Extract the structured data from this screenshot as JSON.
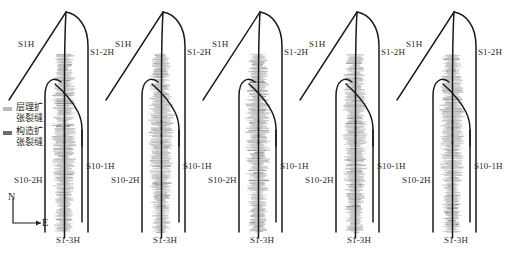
{
  "figure": {
    "type": "well-trajectory-microseismic-map",
    "background": "#ffffff",
    "panel_count": 5,
    "panel_pitch_px": 97,
    "panel_first_x_px": 8
  },
  "legend": {
    "items": [
      {
        "swatch_color": "#b9b9b9",
        "label": "层理扩\n张裂缝",
        "line1": "层理扩",
        "line2": "张裂缝",
        "key": "bedding-expansion-fracture"
      },
      {
        "swatch_color": "#6e6e6e",
        "label": "构造扩\n张裂缝",
        "line1": "构造扩",
        "line2": "张裂缝",
        "key": "structural-expansion-fracture"
      }
    ]
  },
  "compass": {
    "north_label": "N",
    "east_label": "E"
  },
  "well_labels": {
    "s1h": "S1H",
    "s1_2h": "S1-2H",
    "s1_3h": "S1-3H",
    "s10_1h": "S10-1H",
    "s10_2h": "S10-2H"
  },
  "panels": [
    {
      "index": 0,
      "x": 8,
      "labels": {
        "s1h": "S1H",
        "s1_2h": "S1-2H",
        "s1_3h": "S1-3H",
        "s10_1h": "S10-1H",
        "s10_2h": "S10-2H"
      }
    },
    {
      "index": 1,
      "x": 105,
      "labels": {
        "s1h": "S1H",
        "s1_2h": "S1-2H",
        "s1_3h": "S1-3H",
        "s10_1h": "S10-1H",
        "s10_2h": "S10-2H"
      }
    },
    {
      "index": 2,
      "x": 202,
      "labels": {
        "s1h": "S1H",
        "s1_2h": "S1-2H",
        "s1_3h": "S1-3H",
        "s10_1h": "S10-1H",
        "s10_2h": "S10-2H"
      }
    },
    {
      "index": 3,
      "x": 299,
      "labels": {
        "s1h": "S1H",
        "s1_2h": "S1-2H",
        "s1_3h": "S1-3H",
        "s10_1h": "S10-1H",
        "s10_2h": "S10-2H"
      }
    },
    {
      "index": 4,
      "x": 396,
      "labels": {
        "s1h": "S1H",
        "s1_2h": "S1-2H",
        "s1_3h": "S1-3H",
        "s10_1h": "S10-1H",
        "s10_2h": "S10-2H"
      }
    }
  ],
  "colors": {
    "well_line": "#1a1a1a",
    "fracture_cloud_light": "#c4c4c4",
    "fracture_cloud_dark": "#7a7a7a",
    "text": "#2b2b2b"
  }
}
